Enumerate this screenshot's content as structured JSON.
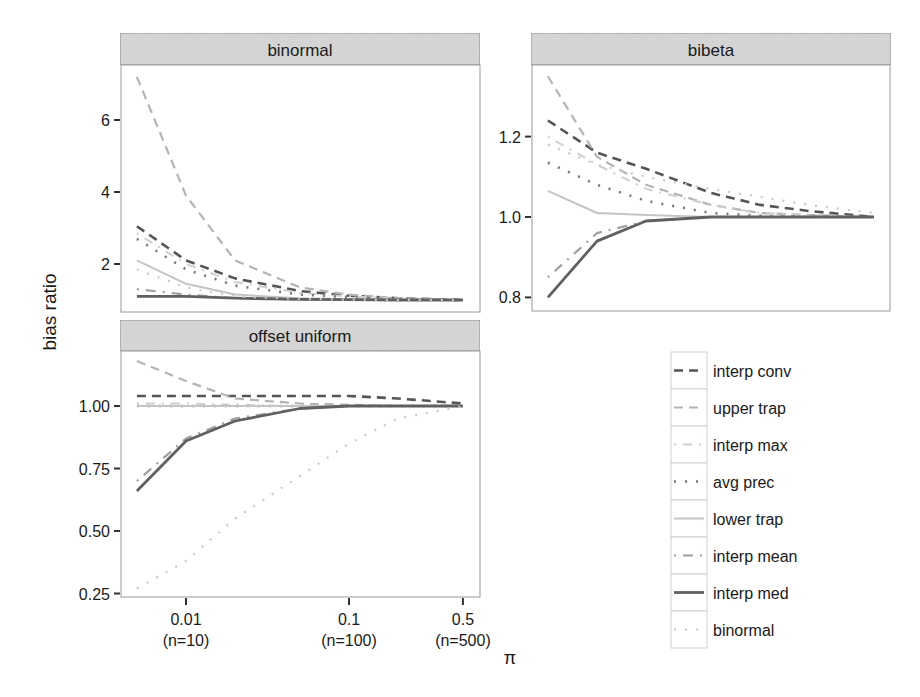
{
  "figure": {
    "ylabel": "bias ratio",
    "xlabel": "π",
    "x_ticks": [
      {
        "value": 0.01,
        "label": "0.01",
        "sublabel": "(n=10)"
      },
      {
        "value": 0.1,
        "label": "0.1",
        "sublabel": "(n=100)"
      },
      {
        "value": 0.5,
        "label": "0.5",
        "sublabel": "(n=500)"
      }
    ]
  },
  "legend": {
    "items": [
      {
        "label": "interp conv",
        "color": "#555555",
        "dash": "9,6",
        "width": 2.6
      },
      {
        "label": "upper trap",
        "color": "#b4b4b4",
        "dash": "9,6",
        "width": 2.2
      },
      {
        "label": "interp max",
        "color": "#cfcfcf",
        "dash": "2,7,9,7",
        "width": 2.0
      },
      {
        "label": "avg prec",
        "color": "#777777",
        "dash": "2,9",
        "width": 2.6
      },
      {
        "label": "lower trap",
        "color": "#c4c4c4",
        "dash": "",
        "width": 2.0
      },
      {
        "label": "interp mean",
        "color": "#a0a0a0",
        "dash": "2,7,10,7",
        "width": 2.2
      },
      {
        "label": "interp med",
        "color": "#606060",
        "dash": "",
        "width": 2.8
      },
      {
        "label": "binormal",
        "color": "#c8c8c8",
        "dash": "2,9",
        "width": 2.2
      }
    ]
  },
  "chart_data": [
    {
      "type": "line",
      "title": "binormal",
      "xlabel": "π",
      "ylabel": "bias ratio",
      "x_scale": "log",
      "x": [
        0.005,
        0.01,
        0.02,
        0.05,
        0.1,
        0.2,
        0.5
      ],
      "y_ticks": [
        2,
        4,
        6
      ],
      "ylim": [
        0.7,
        7.5
      ],
      "grid": false,
      "series": [
        {
          "name": "interp conv",
          "values": [
            3.05,
            2.1,
            1.6,
            1.25,
            1.12,
            1.05,
            1.0
          ]
        },
        {
          "name": "upper trap",
          "values": [
            7.2,
            3.9,
            2.1,
            1.35,
            1.15,
            1.05,
            1.0
          ]
        },
        {
          "name": "interp max",
          "values": [
            2.85,
            2.0,
            1.5,
            1.2,
            1.1,
            1.04,
            1.0
          ]
        },
        {
          "name": "avg prec",
          "values": [
            2.7,
            1.85,
            1.4,
            1.15,
            1.08,
            1.03,
            1.0
          ]
        },
        {
          "name": "lower trap",
          "values": [
            2.1,
            1.45,
            1.15,
            1.05,
            1.02,
            1.01,
            1.0
          ]
        },
        {
          "name": "interp mean",
          "values": [
            1.3,
            1.15,
            1.05,
            1.02,
            1.01,
            1.0,
            1.0
          ]
        },
        {
          "name": "interp med",
          "values": [
            1.1,
            1.1,
            1.05,
            1.02,
            1.01,
            1.0,
            1.0
          ]
        },
        {
          "name": "binormal",
          "values": [
            1.85,
            1.35,
            1.1,
            1.03,
            1.01,
            1.0,
            1.0
          ]
        }
      ]
    },
    {
      "type": "line",
      "title": "bibeta",
      "xlabel": "π",
      "ylabel": "bias ratio",
      "x_scale": "log",
      "x": [
        0.005,
        0.01,
        0.02,
        0.05,
        0.1,
        0.2,
        0.5
      ],
      "y_ticks": [
        0.8,
        1.0,
        1.2
      ],
      "ylim": [
        0.77,
        1.38
      ],
      "grid": false,
      "series": [
        {
          "name": "interp conv",
          "values": [
            1.24,
            1.16,
            1.12,
            1.06,
            1.03,
            1.015,
            1.0
          ]
        },
        {
          "name": "upper trap",
          "values": [
            1.35,
            1.15,
            1.08,
            1.03,
            1.01,
            1.005,
            1.0
          ]
        },
        {
          "name": "interp max",
          "values": [
            1.2,
            1.13,
            1.07,
            1.03,
            1.01,
            1.005,
            1.0
          ]
        },
        {
          "name": "avg prec",
          "values": [
            1.135,
            1.08,
            1.04,
            1.01,
            1.003,
            1.0,
            1.0
          ]
        },
        {
          "name": "lower trap",
          "values": [
            1.065,
            1.01,
            1.005,
            1.0,
            1.0,
            1.0,
            1.0
          ]
        },
        {
          "name": "interp mean",
          "values": [
            0.85,
            0.96,
            0.99,
            1.0,
            1.0,
            1.0,
            1.0
          ]
        },
        {
          "name": "interp med",
          "values": [
            0.8,
            0.94,
            0.99,
            1.0,
            1.0,
            1.0,
            1.0
          ]
        },
        {
          "name": "binormal",
          "values": [
            1.18,
            1.13,
            1.1,
            1.07,
            1.05,
            1.03,
            1.01
          ]
        }
      ]
    },
    {
      "type": "line",
      "title": "offset uniform",
      "xlabel": "π",
      "ylabel": "bias ratio",
      "x_scale": "log",
      "x": [
        0.005,
        0.01,
        0.02,
        0.05,
        0.1,
        0.2,
        0.5
      ],
      "y_ticks": [
        0.25,
        0.5,
        0.75,
        1.0
      ],
      "y_tick_labels": [
        "0.25",
        "0.50",
        "0.75",
        "1.00"
      ],
      "ylim": [
        0.23,
        1.22
      ],
      "grid": false,
      "series": [
        {
          "name": "interp conv",
          "values": [
            1.04,
            1.04,
            1.04,
            1.04,
            1.04,
            1.03,
            1.01
          ]
        },
        {
          "name": "upper trap",
          "values": [
            1.18,
            1.1,
            1.03,
            1.01,
            1.005,
            1.0,
            1.0
          ]
        },
        {
          "name": "interp max",
          "values": [
            1.01,
            1.01,
            1.005,
            1.0,
            1.0,
            1.0,
            1.0
          ]
        },
        {
          "name": "avg prec",
          "values": [
            1.0,
            1.0,
            1.0,
            1.0,
            1.0,
            1.0,
            1.0
          ]
        },
        {
          "name": "lower trap",
          "values": [
            1.0,
            1.0,
            1.0,
            1.0,
            1.0,
            1.0,
            1.0
          ]
        },
        {
          "name": "interp mean",
          "values": [
            0.7,
            0.87,
            0.95,
            0.99,
            1.0,
            1.0,
            1.0
          ]
        },
        {
          "name": "interp med",
          "values": [
            0.66,
            0.86,
            0.94,
            0.99,
            1.0,
            1.0,
            1.0
          ]
        },
        {
          "name": "binormal",
          "values": [
            0.27,
            0.38,
            0.55,
            0.72,
            0.85,
            0.95,
            1.0
          ]
        }
      ]
    }
  ]
}
